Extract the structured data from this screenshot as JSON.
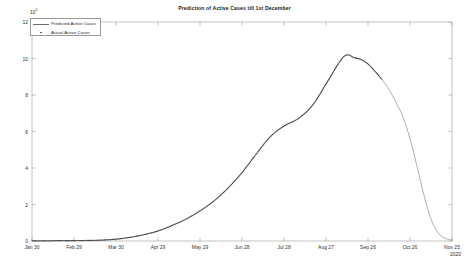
{
  "chart_data": {
    "type": "line",
    "title": "Prediction of Active Cases till 1st December",
    "xlabel": "",
    "ylabel": "",
    "year_label": "2020",
    "y_exponent_text": "10",
    "y_exponent_power": "5",
    "y_axis_multiplier": 100000,
    "ylim": [
      0,
      12
    ],
    "yticks": [
      0,
      2,
      4,
      6,
      8,
      10,
      12
    ],
    "ytick_labels": [
      "0",
      "2",
      "4",
      "6",
      "8",
      "10",
      "12"
    ],
    "xlim_labels": [
      "Jan 30",
      "Nov 25"
    ],
    "xticks": [
      "Jan 30",
      "Feb 29",
      "Mar 30",
      "Apr 29",
      "May 29",
      "Jun 28",
      "Jul 28",
      "Aug 27",
      "Sep 26",
      "Oct 26",
      "Nov 25"
    ],
    "grid": false,
    "legend_position": "top-left",
    "legend": [
      {
        "label": "Predicted Active Cases",
        "marker": "line",
        "color": "#6e6e6e"
      },
      {
        "label": "Actual Active Cases",
        "marker": "dot",
        "color": "#3c3c3c"
      }
    ],
    "series": [
      {
        "name": "Predicted Active Cases",
        "marker": "line",
        "color": "#6e6e6e",
        "x_days": [
          0,
          10,
          20,
          30,
          40,
          50,
          60,
          70,
          80,
          90,
          100,
          110,
          120,
          130,
          140,
          150,
          160,
          170,
          180,
          190,
          200,
          210,
          220,
          225,
          230,
          235,
          240,
          245,
          250,
          255,
          260,
          265,
          270,
          275,
          280,
          285,
          290,
          295,
          300
        ],
        "values": [
          0.01,
          0.01,
          0.02,
          0.02,
          0.03,
          0.05,
          0.1,
          0.2,
          0.35,
          0.55,
          0.85,
          1.2,
          1.65,
          2.2,
          2.9,
          3.75,
          4.75,
          5.7,
          6.3,
          6.7,
          7.4,
          8.6,
          9.85,
          10.2,
          10.05,
          9.95,
          9.7,
          9.3,
          8.85,
          8.3,
          7.6,
          6.8,
          5.6,
          4.1,
          2.5,
          1.2,
          0.45,
          0.15,
          0.05
        ]
      },
      {
        "name": "Actual Active Cases",
        "marker": "dot",
        "color": "#3c3c3c",
        "x_days": [
          0,
          10,
          20,
          30,
          40,
          50,
          60,
          70,
          80,
          90,
          100,
          110,
          120,
          130,
          140,
          150,
          160,
          170,
          180,
          190,
          200,
          210,
          220,
          225,
          230,
          235,
          240,
          245,
          250
        ],
        "values": [
          0.01,
          0.01,
          0.02,
          0.02,
          0.03,
          0.05,
          0.1,
          0.2,
          0.35,
          0.55,
          0.85,
          1.2,
          1.65,
          2.2,
          2.9,
          3.75,
          4.75,
          5.7,
          6.3,
          6.7,
          7.4,
          8.6,
          9.85,
          10.2,
          10.05,
          9.95,
          9.7,
          9.3,
          8.85
        ]
      }
    ],
    "annotations": {
      "peak_value": 10.2,
      "peak_label": "Sep 17",
      "actual_data_end": "Oct 08"
    }
  }
}
